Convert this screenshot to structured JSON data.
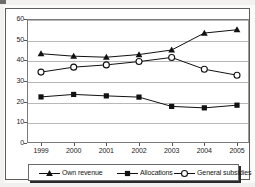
{
  "chart_data": {
    "type": "line",
    "title": "",
    "subtitle": "",
    "xlabel": "",
    "ylabel": "",
    "categories": [
      "1999",
      "2000",
      "2001",
      "2002",
      "2003",
      "2004",
      "2005"
    ],
    "ylim": [
      0,
      60
    ],
    "yticks": [
      0,
      10,
      20,
      30,
      40,
      50,
      60
    ],
    "ytick_labels": [
      "0",
      "10",
      "20",
      "30",
      "40",
      "50",
      "60"
    ],
    "grid": true,
    "grid_axis": "y",
    "legend_position": "bottom",
    "series": [
      {
        "name": "Own revenue",
        "marker": "filled-triangle",
        "color": "#111111",
        "values": [
          43.2,
          42.0,
          41.5,
          42.8,
          45.0,
          53.2,
          54.8
        ]
      },
      {
        "name": "Allocations",
        "marker": "filled-square",
        "color": "#111111",
        "values": [
          22.3,
          23.5,
          22.8,
          22.2,
          17.7,
          17.0,
          18.3
        ]
      },
      {
        "name": "General subsidies",
        "marker": "open-circle",
        "color": "#111111",
        "values": [
          34.3,
          36.7,
          37.8,
          39.4,
          41.4,
          35.7,
          32.8
        ]
      }
    ]
  },
  "legend": {
    "items": [
      {
        "label": "Own revenue",
        "marker": "filled-triangle"
      },
      {
        "label": "Allocations",
        "marker": "filled-square"
      },
      {
        "label": "General subsidies",
        "marker": "open-circle"
      }
    ]
  },
  "colors": {
    "line": "#111111",
    "grid": "#b8b8b8",
    "frame": "#5d5d5d",
    "text": "#1b1b1b",
    "background": "#ffffff"
  }
}
